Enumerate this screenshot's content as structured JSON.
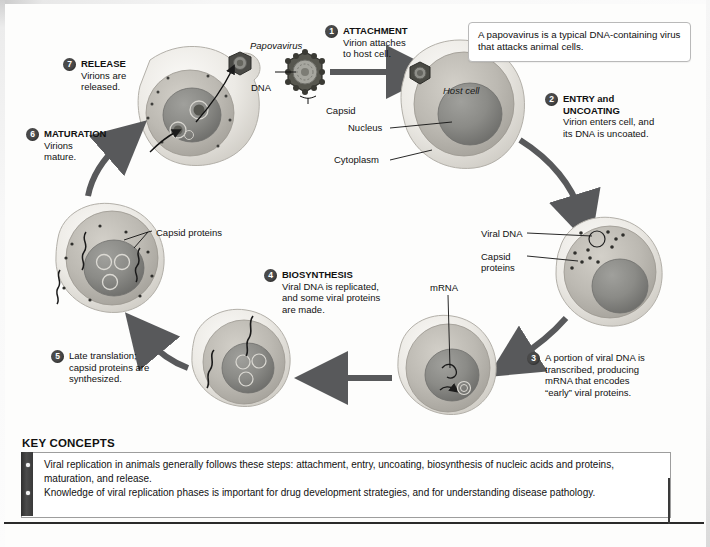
{
  "figure": {
    "virus_label": "Papovavirus",
    "callout": "A papovavirus is a typical DNA-containing virus that attacks animal cells.",
    "host_cell_label": "Host cell"
  },
  "part_labels": {
    "dna": "DNA",
    "capsid": "Capsid",
    "nucleus": "Nucleus",
    "cytoplasm": "Cytoplasm",
    "viral_dna": "Viral DNA",
    "capsid_proteins_right": "Capsid\nproteins",
    "capsid_proteins_right_line1": "Capsid",
    "capsid_proteins_right_line2": "proteins",
    "mrna": "mRNA",
    "capsid_proteins_left": "Capsid proteins"
  },
  "steps": [
    {
      "number": "1",
      "title": "ATTACHMENT",
      "description": "Virion attaches\nto host cell.",
      "desc_lines": [
        "Virion attaches",
        "to host cell."
      ]
    },
    {
      "number": "2",
      "title": "ENTRY and\nUNCOATING",
      "title_lines": [
        "ENTRY and",
        "UNCOATING"
      ],
      "title_suffix": " and",
      "description": "Virion enters cell, and\nits DNA is uncoated.",
      "desc_lines": [
        "Virion enters cell, and",
        "its DNA is uncoated."
      ]
    },
    {
      "number": "3",
      "title": "",
      "description": "A portion of viral DNA is transcribed, producing mRNA that encodes “early” viral proteins.",
      "desc_lines": [
        "A portion of viral DNA is",
        "transcribed, producing",
        "mRNA that encodes",
        "“early” viral proteins."
      ]
    },
    {
      "number": "4",
      "title": "BIOSYNTHESIS",
      "description": "Viral DNA is replicated, and some viral proteins are made.",
      "desc_lines": [
        "Viral DNA is replicated,",
        "and some viral proteins",
        "are made."
      ]
    },
    {
      "number": "5",
      "title": "",
      "description": "Late translation; capsid proteins are synthesized.",
      "desc_lines": [
        "Late translation;",
        "capsid proteins are",
        "synthesized."
      ]
    },
    {
      "number": "6",
      "title": "MATURATION",
      "description": "Virions mature.",
      "desc_lines": [
        "Virions",
        "mature."
      ]
    },
    {
      "number": "7",
      "title": "RELEASE",
      "description": "Virions are released.",
      "desc_lines": [
        "Virions are",
        "released."
      ]
    }
  ],
  "key_concepts": {
    "heading": "KEY CONCEPTS",
    "items": [
      "Viral replication in animals generally follows these steps: attachment, entry, uncoating, biosynthesis of nucleic acids and proteins, maturation, and release.",
      "Knowledge of viral replication phases is important for drug development strategies, and for understanding disease pathology."
    ]
  },
  "colors": {
    "badge": "#4a4a4a",
    "arrow": "#58595b",
    "cell_membrane": "#e9e7e2",
    "cytoplasm": "#bdbab3",
    "nucleus": "#8b8b88",
    "bar": "#3a3a3a",
    "rule": "#2a2a2a"
  }
}
